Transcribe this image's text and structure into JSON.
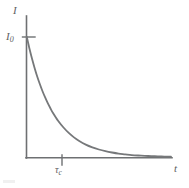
{
  "figure": {
    "name": "exponential-decay-plot",
    "background_color": "#ffffff",
    "line_color": "#6e7072",
    "curve_color": "#76787a",
    "text_color": "#5e6062"
  },
  "labels": {
    "y_axis": "I",
    "y_value": "I",
    "y_value_sub": "0",
    "x_axis": "t",
    "tau": "τ",
    "tau_sub": "c"
  },
  "chart_data": {
    "type": "line",
    "title": "",
    "xlabel": "t",
    "ylabel": "I",
    "grid": false,
    "legend": null,
    "annotations": [
      {
        "text": "I0",
        "axis": "y",
        "value": 1.0,
        "tick": true
      },
      {
        "text": "τc",
        "axis": "x",
        "value": 1.0,
        "tick": true
      }
    ],
    "xlim": [
      0,
      5.5
    ],
    "ylim": [
      0,
      1.18
    ],
    "xticks": [
      1.0
    ],
    "xticklabels": [
      "τc"
    ],
    "yticks": [
      1.0
    ],
    "yticklabels": [
      "I0"
    ],
    "series": [
      {
        "name": "I = I0 exp(-t/τc)",
        "x": [
          0.0,
          0.1,
          0.2,
          0.3,
          0.4,
          0.5,
          0.6,
          0.7,
          0.8,
          0.9,
          1.0,
          1.2,
          1.4,
          1.6,
          1.8,
          2.0,
          2.25,
          2.5,
          2.75,
          3.0,
          3.25,
          3.5,
          3.75,
          4.0,
          4.25,
          4.5,
          4.75,
          5.0,
          5.25,
          5.5
        ],
        "y": [
          1.0,
          0.905,
          0.819,
          0.741,
          0.67,
          0.607,
          0.549,
          0.497,
          0.449,
          0.407,
          0.368,
          0.301,
          0.247,
          0.202,
          0.165,
          0.135,
          0.105,
          0.082,
          0.064,
          0.05,
          0.039,
          0.03,
          0.024,
          0.018,
          0.014,
          0.011,
          0.009,
          0.007,
          0.005,
          0.004
        ]
      }
    ]
  }
}
